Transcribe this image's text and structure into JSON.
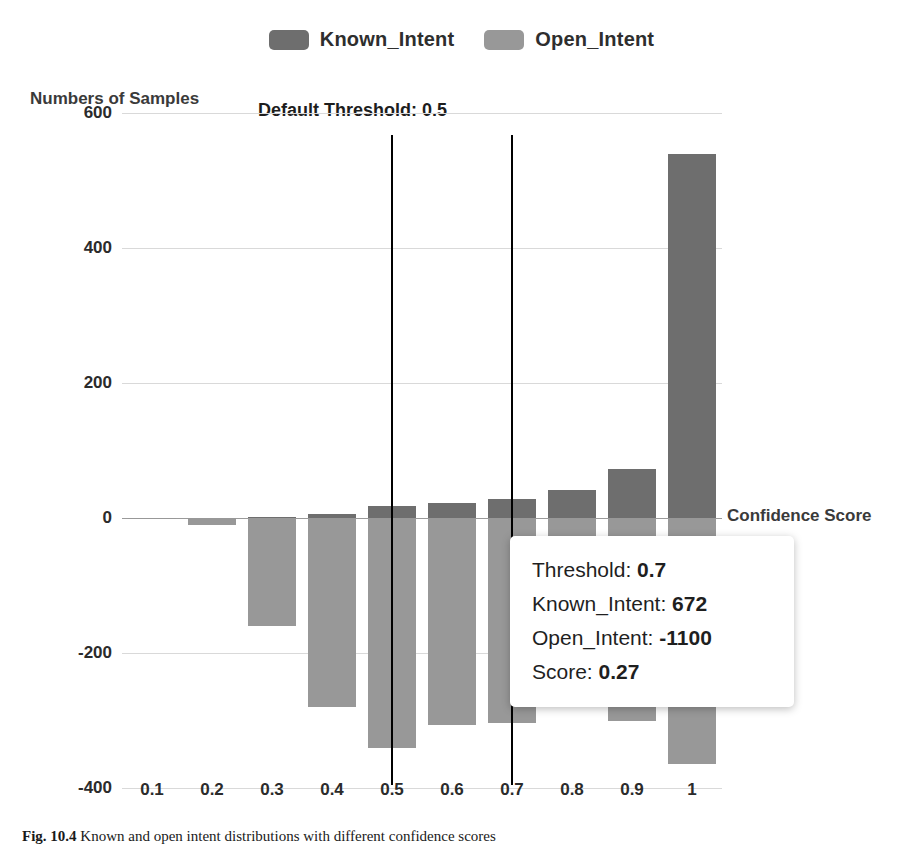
{
  "legend": {
    "entries": [
      {
        "label": "Known_Intent",
        "color": "#6e6e6e"
      },
      {
        "label": "Open_Intent",
        "color": "#989898"
      }
    ]
  },
  "annotations": {
    "default_threshold": "Default Threshold: 0.5"
  },
  "tooltip": {
    "rows": [
      {
        "key": "Threshold:",
        "value": "0.7"
      },
      {
        "key": "Known_Intent:",
        "value": "672"
      },
      {
        "key": "Open_Intent:",
        "value": "-1100"
      },
      {
        "key": "Score:",
        "value": "0.27"
      }
    ]
  },
  "caption": {
    "figure_number": "Fig. 10.4",
    "text": "Known and open intent distributions with different confidence scores"
  },
  "chart_data": {
    "type": "bar",
    "title": "",
    "xlabel": "Confidence Score",
    "ylabel": "Numbers of Samples",
    "categories": [
      "0.1",
      "0.2",
      "0.3",
      "0.4",
      "0.5",
      "0.6",
      "0.7",
      "0.8",
      "0.9",
      "1"
    ],
    "ylim": [
      -400,
      600
    ],
    "yticks": [
      600,
      400,
      200,
      0,
      -200,
      -400
    ],
    "grid": true,
    "legend_position": "top-center",
    "stacked": false,
    "diverging": true,
    "series": [
      {
        "name": "Known_Intent",
        "color": "#6e6e6e",
        "values": [
          0,
          0,
          1,
          6,
          18,
          22,
          28,
          42,
          72,
          540
        ]
      },
      {
        "name": "Open_Intent",
        "color": "#989898",
        "values": [
          -1,
          -10,
          -160,
          -280,
          -340,
          -307,
          -303,
          -215,
          -300,
          -365
        ]
      }
    ],
    "annotations": [
      {
        "type": "vline",
        "x": "0.5",
        "label": "Default Threshold: 0.5",
        "color": "#000000"
      },
      {
        "type": "vline",
        "x": "0.7",
        "label": "",
        "color": "#000000"
      }
    ]
  }
}
